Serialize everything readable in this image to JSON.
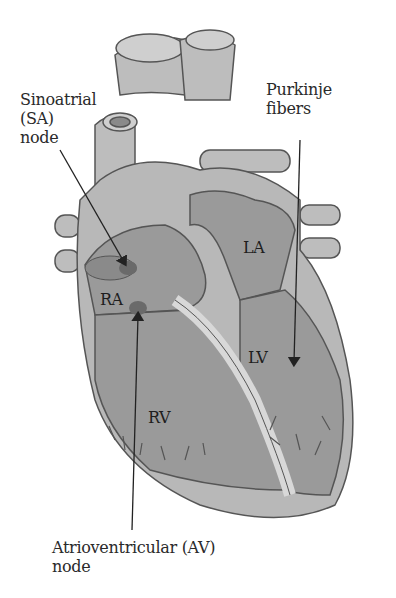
{
  "diagram": {
    "labels": {
      "sa_node": [
        "Sinoatrial",
        "(SA)",
        "node"
      ],
      "purkinje": [
        "Purkinje",
        "fibers"
      ],
      "av_node": [
        "Atrioventricular (AV)",
        "node"
      ]
    },
    "chambers": {
      "ra": "RA",
      "la": "LA",
      "rv": "RV",
      "lv": "LV"
    },
    "colors": {
      "background": "#ffffff",
      "heart_outer": "#b8b8b8",
      "heart_inner": "#9a9a9a",
      "wall": "#d4d4d4",
      "outline": "#555555",
      "node": "#6a6a6a",
      "text": "#2a2a2a"
    }
  }
}
